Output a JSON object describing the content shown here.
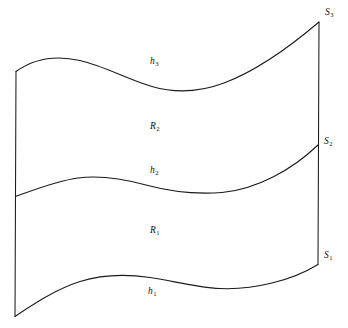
{
  "figure": {
    "kind": "mathematical-surface-diagram",
    "background_color": "#ffffff",
    "stroke_color": "#1a1a1a",
    "width": 348,
    "height": 328,
    "boundary_curves": [
      {
        "id": "h3",
        "base": "h",
        "subscript": "3",
        "role": "top-boundary-curve",
        "label_x": 150,
        "label_y": 57,
        "path": "M 16.0 71.5 C 36 57.0, 58 55.5, 80 60.5 C 104 66.0, 128 79.5, 152 86.5 C 176 93.5, 200 92.0, 224 83.0 C 256 71.0, 292 45.0, 319.0 22.0"
      },
      {
        "id": "h2",
        "base": "h",
        "subscript": "2",
        "role": "middle-boundary-curve",
        "label_x": 150,
        "label_y": 166,
        "path": "M 15.5 196.5 C 34 190.0, 56 181.0, 78 178.0 C 100 175.0, 122 178.5, 146 185.0 C 170 191.5, 196 194.5, 222 192.5 C 256 189.5, 292 170.0, 318.0 145.0"
      },
      {
        "id": "h1",
        "base": "h",
        "subscript": "1",
        "role": "bottom-boundary-curve",
        "label_x": 148,
        "label_y": 287,
        "path": "M 15.0 316.5 C 32 305.0, 56 289.0, 80 281.5 C 102 274.5, 126 274.0, 150 277.5 C 174 281.0, 196 287.5, 220 288.5 C 254 290.0, 292 280.5, 318.0 264.5"
      }
    ],
    "side_edges": [
      {
        "id": "left-edge",
        "role": "left-side-edge",
        "path": "M 16.0 71.5 L 15.0 316.5"
      },
      {
        "id": "right-edge",
        "role": "right-side-edge",
        "path": "M 319.0 22.0 L 318.0 264.5"
      }
    ],
    "region_labels": [
      {
        "id": "R2",
        "base": "R",
        "subscript": "2",
        "x": 150,
        "y": 122
      },
      {
        "id": "R1",
        "base": "R",
        "subscript": "1",
        "x": 150,
        "y": 226
      }
    ],
    "section_labels": [
      {
        "id": "S3",
        "base": "S",
        "subscript": "3",
        "x": 325,
        "y": 8
      },
      {
        "id": "S2",
        "base": "S",
        "subscript": "2",
        "x": 324,
        "y": 137
      },
      {
        "id": "S1",
        "base": "S",
        "subscript": "1",
        "x": 324,
        "y": 251
      }
    ]
  }
}
